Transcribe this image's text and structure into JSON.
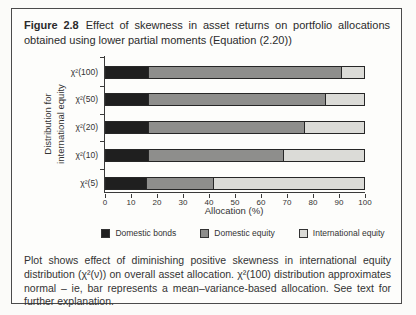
{
  "title": {
    "label": "Figure 2.8",
    "text": "Effect of skewness in asset returns on portfolio allocations obtained using lower partial moments (Equation (2.20))"
  },
  "chart_data": {
    "type": "bar",
    "orientation": "horizontal",
    "stacked": true,
    "title": "",
    "categories": [
      "χ²(100)",
      "χ²(50)",
      "χ²(20)",
      "χ²(10)",
      "χ²(5)"
    ],
    "series": [
      {
        "name": "Domestic bonds",
        "color": "#1f1f1f",
        "values": [
          17,
          17,
          17,
          17,
          16
        ]
      },
      {
        "name": "Domestic equity",
        "color": "#8e8e8c",
        "values": [
          74,
          68,
          60,
          52,
          26
        ]
      },
      {
        "name": "International equity",
        "color": "#dbdbd7",
        "values": [
          9,
          15,
          23,
          31,
          58
        ]
      }
    ],
    "xlabel": "Allocation (%)",
    "ylabel": "Distribution for international equity",
    "ylabel_lines": [
      "Distribution for",
      "international equity"
    ],
    "xlim": [
      0,
      100
    ],
    "xticks": [
      0,
      10,
      20,
      30,
      40,
      50,
      60,
      70,
      80,
      90,
      100
    ],
    "grid": false,
    "legend_position": "bottom"
  },
  "caption": {
    "text": "Plot shows effect of diminishing positive skewness in international equity distribution (χ²(ν)) on overall asset allocation. χ²(100) distribution approximates normal – ie, bar represents a mean–variance-based allocation. See text for further explanation."
  }
}
